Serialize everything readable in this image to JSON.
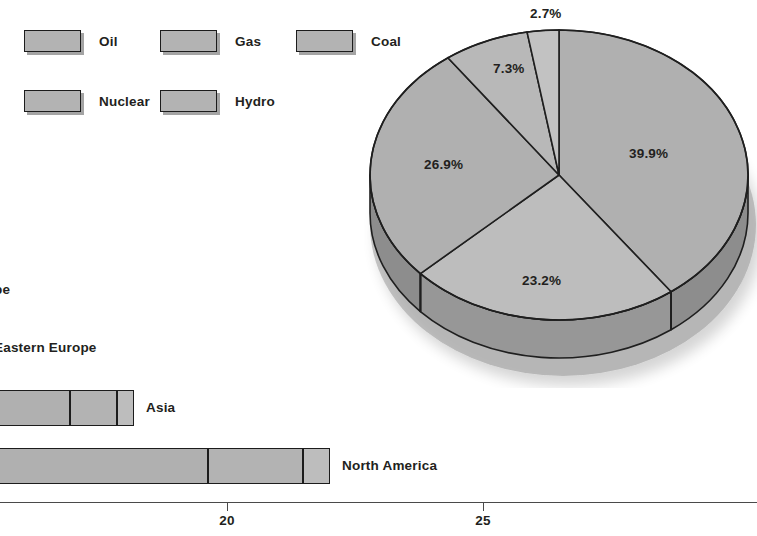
{
  "legend": {
    "items": [
      {
        "label": "Oil",
        "color": "#b3b3b3",
        "x": 24,
        "y": 30
      },
      {
        "label": "Gas",
        "color": "#b3b3b3",
        "x": 160,
        "y": 30
      },
      {
        "label": "Coal",
        "color": "#b3b3b3",
        "x": 296,
        "y": 30
      },
      {
        "label": "Nuclear",
        "color": "#b3b3b3",
        "x": 24,
        "y": 90
      },
      {
        "label": "Hydro",
        "color": "#b3b3b3",
        "x": 160,
        "y": 90
      }
    ]
  },
  "chart_data": [
    {
      "type": "pie",
      "title": "",
      "labels": [
        "Oil",
        "Gas",
        "Coal",
        "Nuclear",
        "Hydro"
      ],
      "values": [
        39.9,
        23.2,
        26.9,
        7.3,
        2.7
      ],
      "data_labels": [
        "39.9%",
        "23.2%",
        "26.9%",
        "7.3%",
        "2.7%"
      ],
      "colors": [
        "#b0b0b0",
        "#bdbdbd",
        "#b0b0b0",
        "#b8b8b8",
        "#c2c2c2"
      ],
      "three_d": true,
      "start_angle_deg": 0,
      "direction": "clockwise",
      "legend_position": "top-left",
      "label_positions": [
        {
          "text": "39.9%",
          "x": 629,
          "y": 146
        },
        {
          "text": "23.2%",
          "x": 522,
          "y": 273
        },
        {
          "text": "26.9%",
          "x": 424,
          "y": 157
        },
        {
          "text": "7.3%",
          "x": 493,
          "y": 61
        },
        {
          "text": "2.7%",
          "x": 530,
          "y": 6
        }
      ]
    },
    {
      "type": "bar",
      "orientation": "horizontal",
      "stacked": true,
      "title": "",
      "xlabel": "",
      "ylabel": "",
      "xlim": [
        15.57,
        29.34
      ],
      "xticks": [
        20,
        25
      ],
      "xtick_labels": [
        "20",
        "25"
      ],
      "grid": false,
      "categories": [
        "Europe",
        "Eastern Europe",
        "Asia",
        "North America"
      ],
      "series": [
        {
          "name": "segment-1",
          "color": "#b0b0b0"
        },
        {
          "name": "segment-2",
          "color": "#b3b3b3"
        },
        {
          "name": "segment-3",
          "color": "#bdbdbd"
        }
      ],
      "bars": [
        {
          "category": "Europe",
          "label": "Europe",
          "label_visible_text": "pe",
          "visible": false,
          "top": 25,
          "label_x": -6,
          "label_y": 27,
          "segments": []
        },
        {
          "category": "Eastern Europe",
          "label": "Eastern Europe",
          "label_visible_text": "Eastern Europe",
          "visible": false,
          "top": 85,
          "label_x": -6,
          "label_y": 85,
          "segments": []
        },
        {
          "category": "Asia",
          "label": "Asia",
          "label_visible_text": "Asia",
          "visible": true,
          "top": 135,
          "left": -40,
          "label_x": 146,
          "label_y": 135,
          "total_end_px": 134,
          "segments": [
            {
              "width": 110,
              "color": "#b0b0b0"
            },
            {
              "width": 47,
              "color": "#b3b3b3"
            },
            {
              "width": 17,
              "color": "#bdbdbd"
            }
          ]
        },
        {
          "category": "North America",
          "label": "North America",
          "label_visible_text": "North America",
          "visible": true,
          "top": 193,
          "left": -40,
          "label_x": 342,
          "label_y": 193,
          "total_end_px": 330,
          "segments": [
            {
              "width": 248,
              "color": "#b0b0b0"
            },
            {
              "width": 95,
              "color": "#b3b3b3"
            },
            {
              "width": 27,
              "color": "#bdbdbd"
            }
          ]
        }
      ],
      "axis": {
        "line_y": 247,
        "ticks": [
          {
            "label": "20",
            "x": 227
          },
          {
            "label": "25",
            "x": 483
          }
        ],
        "tick_label_y": 258
      }
    }
  ]
}
